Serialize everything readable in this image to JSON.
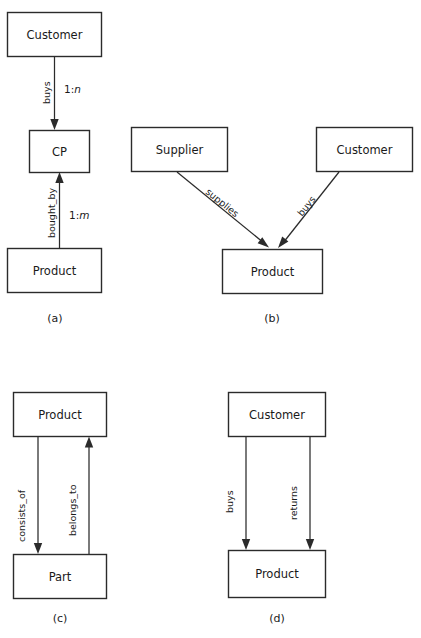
{
  "figure": {
    "colors": {
      "background": "#ffffff",
      "stroke": "#2b2b2b",
      "text": "#1a1a1a"
    },
    "panels": [
      {
        "id": "a",
        "caption": "(a)",
        "entities": [
          {
            "id": "a-customer",
            "label": "Customer"
          },
          {
            "id": "a-cp",
            "label": "CP"
          },
          {
            "id": "a-product",
            "label": "Product"
          }
        ],
        "relationships": [
          {
            "id": "a-buys",
            "label": "buys",
            "cardinality": "1:n",
            "cardinality_prefix": "1:",
            "cardinality_var": "n",
            "from": "Customer",
            "to": "CP",
            "direction": "down"
          },
          {
            "id": "a-bought-by",
            "label": "bought_by",
            "cardinality": "1:m",
            "cardinality_prefix": "1:",
            "cardinality_var": "m",
            "from": "Product",
            "to": "CP",
            "direction": "up"
          }
        ]
      },
      {
        "id": "b",
        "caption": "(b)",
        "entities": [
          {
            "id": "b-supplier",
            "label": "Supplier"
          },
          {
            "id": "b-customer",
            "label": "Customer"
          },
          {
            "id": "b-product",
            "label": "Product"
          }
        ],
        "relationships": [
          {
            "id": "b-supplies",
            "label": "supplies",
            "from": "Supplier",
            "to": "Product",
            "direction": "diagonal-down-right"
          },
          {
            "id": "b-buys",
            "label": "buys",
            "from": "Customer",
            "to": "Product",
            "direction": "diagonal-down-left"
          }
        ]
      },
      {
        "id": "c",
        "caption": "(c)",
        "entities": [
          {
            "id": "c-product",
            "label": "Product"
          },
          {
            "id": "c-part",
            "label": "Part"
          }
        ],
        "relationships": [
          {
            "id": "c-consists-of",
            "label": "consists_of",
            "from": "Product",
            "to": "Part",
            "direction": "down"
          },
          {
            "id": "c-belongs-to",
            "label": "belongs_to",
            "from": "Part",
            "to": "Product",
            "direction": "up"
          }
        ]
      },
      {
        "id": "d",
        "caption": "(d)",
        "entities": [
          {
            "id": "d-customer",
            "label": "Customer"
          },
          {
            "id": "d-product",
            "label": "Product"
          }
        ],
        "relationships": [
          {
            "id": "d-buys",
            "label": "buys",
            "from": "Customer",
            "to": "Product",
            "direction": "down"
          },
          {
            "id": "d-returns",
            "label": "returns",
            "from": "Customer",
            "to": "Product",
            "direction": "down"
          }
        ]
      }
    ]
  }
}
